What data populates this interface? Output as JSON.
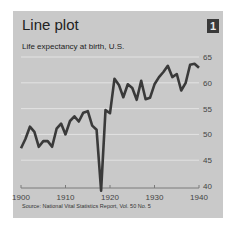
{
  "header": {
    "title": "Line plot",
    "badge": "1"
  },
  "chart_data": {
    "type": "line",
    "title": "Life expectancy at birth, U.S.",
    "xlabel": "",
    "ylabel": "",
    "x_ticks": [
      "1900",
      "1910",
      "1920",
      "1930",
      "1940"
    ],
    "y_ticks": [
      "40",
      "45",
      "50",
      "55",
      "60",
      "65"
    ],
    "xlim": [
      1900,
      1940
    ],
    "ylim": [
      40,
      65
    ],
    "grid": true,
    "series": [
      {
        "name": "Life expectancy",
        "x": [
          1900,
          1901,
          1902,
          1903,
          1904,
          1905,
          1906,
          1907,
          1908,
          1909,
          1910,
          1911,
          1912,
          1913,
          1914,
          1915,
          1916,
          1917,
          1918,
          1919,
          1920,
          1921,
          1922,
          1923,
          1924,
          1925,
          1926,
          1927,
          1928,
          1929,
          1930,
          1931,
          1932,
          1933,
          1934,
          1935,
          1936,
          1937,
          1938,
          1939,
          1940
        ],
        "values": [
          47.3,
          49.1,
          51.5,
          50.5,
          47.6,
          48.7,
          48.7,
          47.6,
          51.1,
          52.1,
          50.0,
          52.6,
          53.5,
          52.5,
          54.2,
          54.5,
          51.7,
          50.9,
          39.1,
          54.7,
          54.1,
          60.8,
          59.6,
          57.2,
          59.7,
          59.0,
          56.7,
          60.4,
          56.8,
          57.1,
          59.7,
          61.1,
          62.1,
          63.3,
          61.1,
          61.7,
          58.5,
          60.0,
          63.5,
          63.7,
          62.9
        ],
        "color": "#3a3a3a"
      }
    ],
    "source": "Source:  National Vital Statistics Report, Vol. 50 No. 5"
  },
  "colors": {
    "background": "#c9c9c9",
    "line": "#3a3a3a",
    "grid": "#e3e3e3"
  }
}
